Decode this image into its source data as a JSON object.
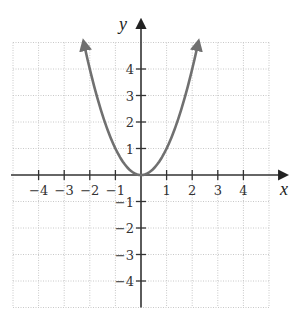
{
  "chart_data": {
    "type": "line",
    "title": "",
    "function": "y = x^2",
    "xlabel": "x",
    "ylabel": "y",
    "xlim": [
      -5,
      5
    ],
    "ylim": [
      -5,
      5
    ],
    "grid": true,
    "x_ticks": [
      -4,
      -3,
      -2,
      -1,
      1,
      2,
      3,
      4
    ],
    "y_ticks": [
      4,
      3,
      2,
      1,
      -1,
      -2,
      -3,
      -4
    ],
    "x_tick_labels": [
      "−4",
      "−3",
      "−2",
      "−1",
      "1",
      "2",
      "3",
      "4"
    ],
    "y_tick_labels": [
      "4",
      "3",
      "2",
      "1",
      "−1",
      "−2",
      "−3",
      "−4"
    ],
    "series": [
      {
        "name": "parabola",
        "color": "#707070",
        "arrows_at_ends": true,
        "x": [
          -2.24,
          -2.0,
          -1.5,
          -1.0,
          -0.5,
          0.0,
          0.5,
          1.0,
          1.5,
          2.0,
          2.24
        ],
        "y": [
          5.02,
          4.0,
          2.25,
          1.0,
          0.25,
          0.0,
          0.25,
          1.0,
          2.25,
          4.0,
          5.02
        ]
      }
    ],
    "legend": null
  },
  "layout": {
    "origin_px": [
      141,
      175
    ],
    "unit_x_px": 25.6,
    "unit_y_px": 26.5
  },
  "labels": {
    "x_axis": "x",
    "y_axis": "y"
  },
  "colors": {
    "curve": "#707070",
    "axis": "#333333",
    "grid": "#c8c8c8"
  }
}
